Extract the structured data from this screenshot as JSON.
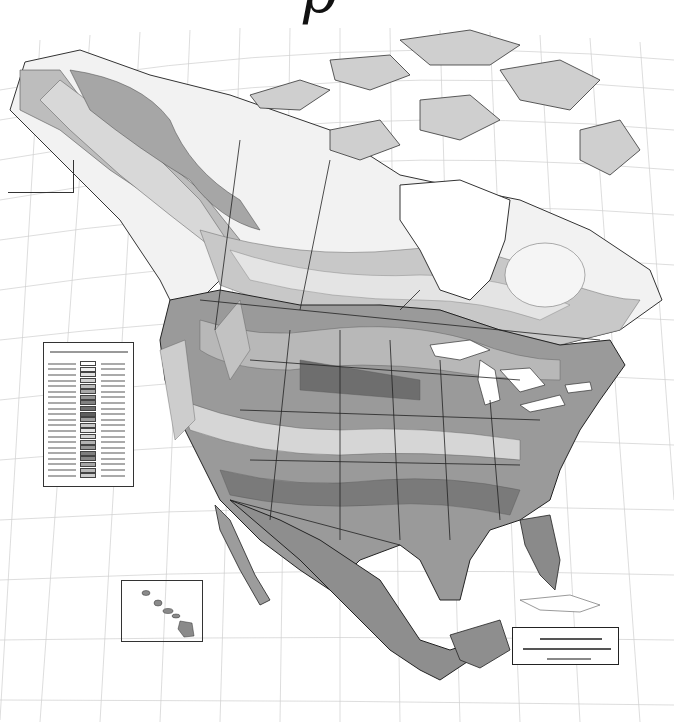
{
  "map": {
    "title_fragment": "p",
    "subject": "plant hardiness zones (average annual minimum temperature)",
    "region": "North America",
    "render": "grayscale",
    "palette": [
      "#ffffff",
      "#e6e6e6",
      "#cfcfcf",
      "#b8b8b8",
      "#a0a0a0",
      "#8a8a8a",
      "#747474",
      "#5e5e5e"
    ],
    "features": {
      "graticule": true,
      "state_province_borders": true,
      "legend_box": {
        "position": "left-middle",
        "rows": 21,
        "text_legible": false
      },
      "scale_box": {
        "position": "bottom-right",
        "text_legible": false
      },
      "insets": [
        "Aleutian Islands (upper-left)",
        "Hawaii (lower-left)"
      ]
    }
  },
  "legend": {
    "swatches": [
      "#ffffff",
      "#f0f0f0",
      "#e0e0e0",
      "#d0d0d0",
      "#bdbdbd",
      "#a8a8a8",
      "#949494",
      "#808080",
      "#6e6e6e",
      "#5e5e5e",
      "#a0a0a0",
      "#c8c8c8",
      "#e4e4e4",
      "#d2d2d2",
      "#b2b2b2",
      "#989898",
      "#7e7e7e",
      "#888888",
      "#a6a6a6",
      "#b8b8b8",
      "#cccccc"
    ]
  }
}
